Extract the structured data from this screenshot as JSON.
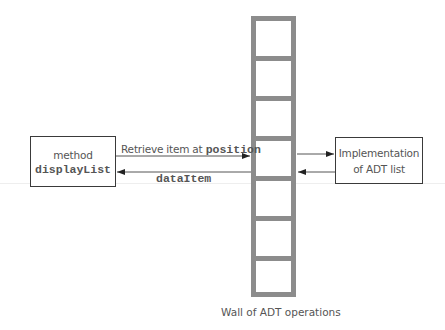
{
  "diagram": {
    "left_box": {
      "line1": "method",
      "line2": "displayList"
    },
    "right_box": {
      "line1": "Implementation",
      "line2": "of ADT list"
    },
    "wall": {
      "label": "Wall of ADT operations",
      "cells": 7
    },
    "arrows": {
      "request_label_prefix": "Retrieve item at ",
      "request_label_code": "position",
      "response_label": "dataItem"
    },
    "colors": {
      "wall": "#8c8c8c",
      "box_border": "#3a3a3a",
      "text": "#555555",
      "arrow": "#444444"
    }
  }
}
